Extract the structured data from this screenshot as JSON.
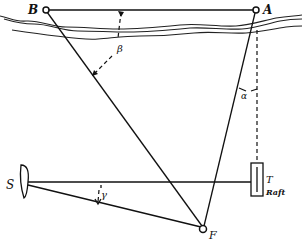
{
  "diagram": {
    "type": "surveying-geometry",
    "labels": {
      "point_b": "B",
      "point_a": "A",
      "point_f": "F",
      "point_s": "S",
      "point_t": "T",
      "raft": "Raft",
      "angle_x": "x",
      "angle_beta": "β",
      "angle_alpha": "α",
      "angle_gamma": "γ"
    },
    "points": {
      "B": [
        46,
        10
      ],
      "A": [
        256,
        10
      ],
      "F": [
        203,
        228
      ],
      "S": [
        28,
        182
      ],
      "T": [
        257,
        182
      ]
    },
    "segments": [
      {
        "from": "B",
        "to": "A",
        "style": "solid"
      },
      {
        "from": "B",
        "to": "F",
        "style": "solid"
      },
      {
        "from": "A",
        "to": "F",
        "style": "solid"
      },
      {
        "from": "S",
        "to": "T",
        "style": "solid"
      },
      {
        "from": "S",
        "to": "F",
        "style": "solid"
      },
      {
        "from": "A",
        "to": "Raft",
        "style": "dashed"
      }
    ],
    "colors": {
      "ink": "#111111",
      "paper": "#ffffff"
    }
  }
}
